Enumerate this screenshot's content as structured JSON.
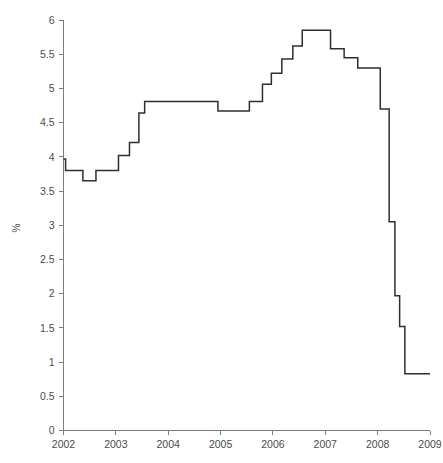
{
  "chart_data": {
    "type": "line",
    "title": "",
    "subtitle": "",
    "xlabel": "",
    "ylabel": "%",
    "xlim": [
      2002,
      2009
    ],
    "ylim": [
      0,
      6
    ],
    "grid": false,
    "legend": null,
    "line_style": "step-post",
    "series_color": "#2f2f2f",
    "axis_color": "#7c7c7c",
    "x_ticks": [
      "2002",
      "2003",
      "2004",
      "2005",
      "2006",
      "2007",
      "2008",
      "2009"
    ],
    "x_tick_values": [
      2002,
      2003,
      2004,
      2005,
      2006,
      2007,
      2008,
      2009
    ],
    "y_ticks": [
      "0",
      "0.5",
      "1",
      "1.5",
      "2",
      "2.5",
      "3",
      "3.5",
      "4",
      "4.5",
      "5",
      "5.5",
      "6"
    ],
    "y_tick_values": [
      0,
      0.5,
      1,
      1.5,
      2,
      2.5,
      3,
      3.5,
      4,
      4.5,
      5,
      5.5,
      6
    ],
    "series": [
      {
        "name": "Rate",
        "x": [
          2002.0,
          2002.04,
          2002.37,
          2002.62,
          2003.05,
          2003.26,
          2003.44,
          2003.55,
          2004.95,
          2005.55,
          2005.8,
          2005.97,
          2006.17,
          2006.38,
          2006.56,
          2007.1,
          2007.36,
          2007.62,
          2008.05,
          2008.22,
          2008.33,
          2009.0
        ],
        "values": [
          3.97,
          3.8,
          3.65,
          3.8,
          4.02,
          4.21,
          4.64,
          4.81,
          4.67,
          4.81,
          5.06,
          5.22,
          5.43,
          5.62,
          5.85,
          5.58,
          5.45,
          5.3,
          4.7,
          3.05,
          1.97,
          0.83
        ],
        "points": [
          {
            "x": 2002.0,
            "y": 3.97
          },
          {
            "x": 2002.04,
            "y": 3.8
          },
          {
            "x": 2002.37,
            "y": 3.65
          },
          {
            "x": 2002.62,
            "y": 3.8
          },
          {
            "x": 2003.05,
            "y": 4.02
          },
          {
            "x": 2003.26,
            "y": 4.21
          },
          {
            "x": 2003.44,
            "y": 4.64
          },
          {
            "x": 2003.55,
            "y": 4.81
          },
          {
            "x": 2004.95,
            "y": 4.67
          },
          {
            "x": 2005.55,
            "y": 4.81
          },
          {
            "x": 2005.8,
            "y": 5.06
          },
          {
            "x": 2005.97,
            "y": 5.22
          },
          {
            "x": 2006.17,
            "y": 5.43
          },
          {
            "x": 2006.38,
            "y": 5.62
          },
          {
            "x": 2006.56,
            "y": 5.85
          },
          {
            "x": 2007.1,
            "y": 5.58
          },
          {
            "x": 2007.36,
            "y": 5.45
          },
          {
            "x": 2007.62,
            "y": 5.3
          },
          {
            "x": 2008.05,
            "y": 4.7
          },
          {
            "x": 2008.22,
            "y": 3.05
          },
          {
            "x": 2008.33,
            "y": 1.97
          },
          {
            "x": 2008.42,
            "y": 1.52
          },
          {
            "x": 2008.52,
            "y": 0.83
          },
          {
            "x": 2009.0,
            "y": 0.83
          }
        ]
      }
    ],
    "annotations": []
  },
  "caption": {
    "text": ""
  }
}
